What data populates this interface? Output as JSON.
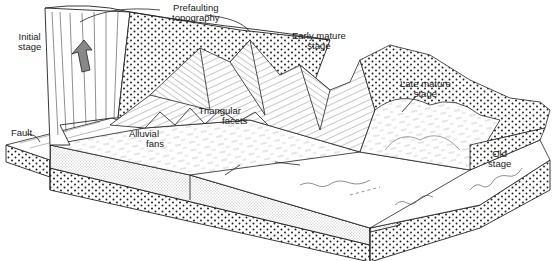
{
  "diagram": {
    "labels": {
      "initial_stage": [
        "Initial",
        "stage"
      ],
      "prefaulting_topography": [
        "Prefaulting",
        "topography"
      ],
      "early_mature_stage": [
        "Early mature",
        "stage"
      ],
      "late_mature_stage": [
        "Late mature",
        "stage"
      ],
      "old_stage": [
        "Old",
        "stage"
      ],
      "fault": "Fault",
      "alluvial_fans": [
        "Alluvial",
        "fans"
      ],
      "triangular_facets": [
        "Triangular",
        "facets"
      ]
    },
    "colors": {
      "ink": "#222222",
      "background": "#ffffff",
      "arrow_fill": "#888888"
    }
  }
}
